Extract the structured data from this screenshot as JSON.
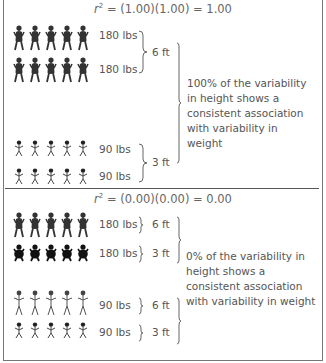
{
  "panels": [
    {
      "formula": {
        "r": "r",
        "exp": "2",
        "rest": " = (1.00)(1.00) = 1.00"
      },
      "rows": [
        {
          "figure": "heavy-tall-figure",
          "count": 5,
          "weight": "180 lbs"
        },
        {
          "figure": "heavy-tall-figure",
          "count": 5,
          "weight": "180 lbs"
        },
        {
          "figure": "light-short-figure",
          "count": 5,
          "weight": "90 lbs"
        },
        {
          "figure": "light-short-figure",
          "count": 5,
          "weight": "90 lbs"
        }
      ],
      "heights": [
        "6 ft",
        "3 ft"
      ],
      "description": "100% of the variability in height shows a consistent association with variability in weight"
    },
    {
      "formula": {
        "r": "r",
        "exp": "2",
        "rest": " = (0.00)(0.00) = 0.00"
      },
      "rows": [
        {
          "figure": "heavy-tall-figure",
          "count": 5,
          "weight": "180 lbs",
          "height": "6 ft"
        },
        {
          "figure": "heavy-short-figure",
          "count": 5,
          "weight": "180 lbs",
          "height": "3 ft"
        },
        {
          "figure": "light-tall-figure",
          "count": 5,
          "weight": "90 lbs",
          "height": "6 ft"
        },
        {
          "figure": "light-short-figure",
          "count": 5,
          "weight": "90 lbs",
          "height": "3 ft"
        }
      ],
      "description": "0% of the variability in height shows a consistent association with variability in weight"
    }
  ]
}
